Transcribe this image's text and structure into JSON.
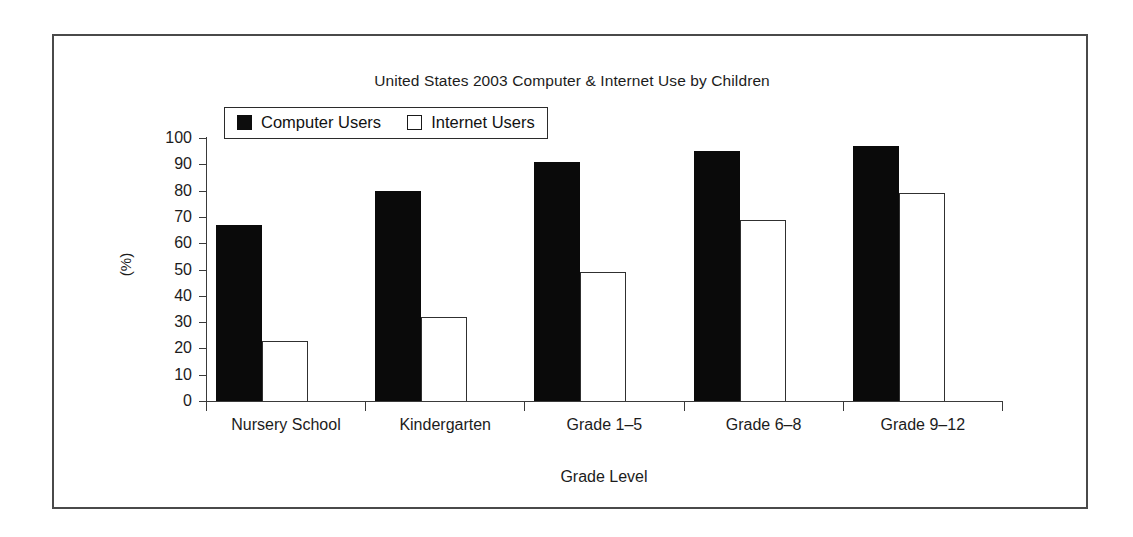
{
  "chart_data": {
    "type": "bar",
    "title": "United States 2003 Computer & Internet Use by Children",
    "xlabel": "Grade Level",
    "ylabel": "(%)",
    "ylim": [
      0,
      100
    ],
    "ytick_step": 10,
    "yticks": [
      100,
      90,
      80,
      70,
      60,
      50,
      40,
      30,
      20,
      10,
      0
    ],
    "grid": false,
    "legend_position": "top-left-inside",
    "categories": [
      "Nursery School",
      "Kindergarten",
      "Grade 1–5",
      "Grade 6–8",
      "Grade 9–12"
    ],
    "series": [
      {
        "name": "Computer Users",
        "style": "filled",
        "color": "#0a0a0a",
        "values": [
          67,
          80,
          91,
          95,
          97
        ]
      },
      {
        "name": "Internet Users",
        "style": "hollow",
        "color": "#ffffff",
        "border_color": "#303030",
        "values": [
          23,
          32,
          49,
          69,
          79
        ]
      }
    ]
  }
}
